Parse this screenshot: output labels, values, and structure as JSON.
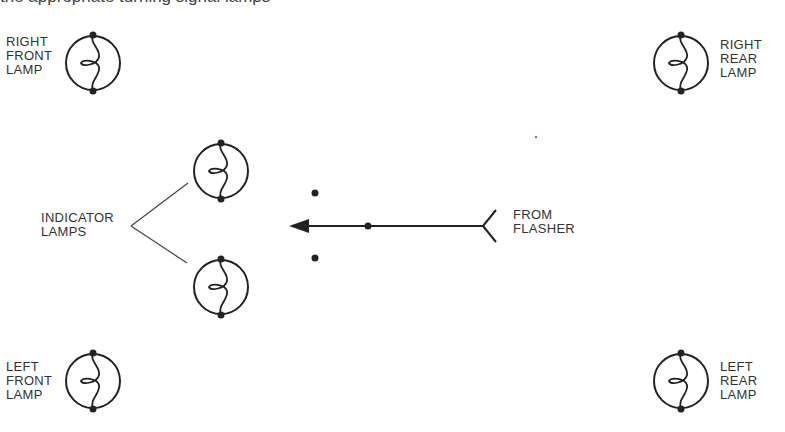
{
  "header": {
    "cut_text": "the appropriate turning signal lamps"
  },
  "colors": {
    "stroke": "#222222",
    "text": "#333333",
    "background": "#ffffff"
  },
  "lamps": [
    {
      "id": "right-front",
      "lines": [
        "RIGHT",
        "FRONT",
        "LAMP"
      ],
      "cx": 93,
      "cy": 63
    },
    {
      "id": "right-rear",
      "lines": [
        "RIGHT",
        "REAR",
        "LAMP"
      ],
      "cx": 681,
      "cy": 63
    },
    {
      "id": "indicator-top",
      "cx": 221,
      "cy": 171
    },
    {
      "id": "indicator-bottom",
      "cx": 221,
      "cy": 287
    },
    {
      "id": "left-front",
      "lines": [
        "LEFT",
        "FRONT",
        "LAMP"
      ],
      "cx": 93,
      "cy": 381
    },
    {
      "id": "left-rear",
      "lines": [
        "LEFT",
        "REAR",
        "LAMP"
      ],
      "cx": 681,
      "cy": 381
    }
  ],
  "indicator_label": {
    "lines": [
      "INDICATOR",
      "LAMPS"
    ]
  },
  "flasher_label": {
    "lines": [
      "FROM",
      "FLASHER"
    ]
  }
}
